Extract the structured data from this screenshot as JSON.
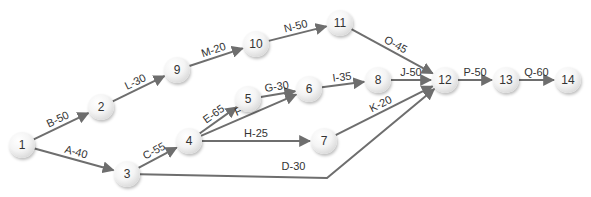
{
  "diagram": {
    "type": "activity-on-arrow network",
    "nodes": [
      {
        "id": "1",
        "label": "1",
        "x": 22,
        "y": 145
      },
      {
        "id": "2",
        "label": "2",
        "x": 101,
        "y": 107
      },
      {
        "id": "3",
        "label": "3",
        "x": 127,
        "y": 174
      },
      {
        "id": "4",
        "label": "4",
        "x": 189,
        "y": 141
      },
      {
        "id": "5",
        "label": "5",
        "x": 248,
        "y": 99
      },
      {
        "id": "6",
        "label": "6",
        "x": 309,
        "y": 89
      },
      {
        "id": "7",
        "label": "7",
        "x": 324,
        "y": 141
      },
      {
        "id": "8",
        "label": "8",
        "x": 378,
        "y": 80
      },
      {
        "id": "9",
        "label": "9",
        "x": 177,
        "y": 70
      },
      {
        "id": "10",
        "label": "10",
        "x": 256,
        "y": 44
      },
      {
        "id": "11",
        "label": "11",
        "x": 340,
        "y": 23
      },
      {
        "id": "12",
        "label": "12",
        "x": 445,
        "y": 80
      },
      {
        "id": "13",
        "label": "13",
        "x": 506,
        "y": 80
      },
      {
        "id": "14",
        "label": "14",
        "x": 568,
        "y": 80
      }
    ],
    "edges": [
      {
        "label": "A-40",
        "from": "1",
        "to": "3"
      },
      {
        "label": "B-50",
        "from": "1",
        "to": "2"
      },
      {
        "label": "C-55",
        "from": "3",
        "to": "4"
      },
      {
        "label": "D-30",
        "from": "3",
        "to": "12",
        "via": [
          327,
          178
        ]
      },
      {
        "label": "E-65",
        "from": "4",
        "to": "5"
      },
      {
        "label": "F-65",
        "from": "4",
        "to": "6"
      },
      {
        "label": "G-30",
        "from": "5",
        "to": "6"
      },
      {
        "label": "H-25",
        "from": "4",
        "to": "7"
      },
      {
        "label": "I-35",
        "from": "6",
        "to": "8"
      },
      {
        "label": "J-50",
        "from": "8",
        "to": "12"
      },
      {
        "label": "K-20",
        "from": "7",
        "to": "12"
      },
      {
        "label": "L-30",
        "from": "2",
        "to": "9"
      },
      {
        "label": "M-20",
        "from": "9",
        "to": "10"
      },
      {
        "label": "N-50",
        "from": "10",
        "to": "11"
      },
      {
        "label": "O-45",
        "from": "11",
        "to": "12"
      },
      {
        "label": "P-50",
        "from": "12",
        "to": "13"
      },
      {
        "label": "Q-60",
        "from": "13",
        "to": "14"
      }
    ]
  },
  "colors": {
    "edge": "#6e6e6e",
    "label": "#333333",
    "node_fill": "#f4f4f4"
  }
}
